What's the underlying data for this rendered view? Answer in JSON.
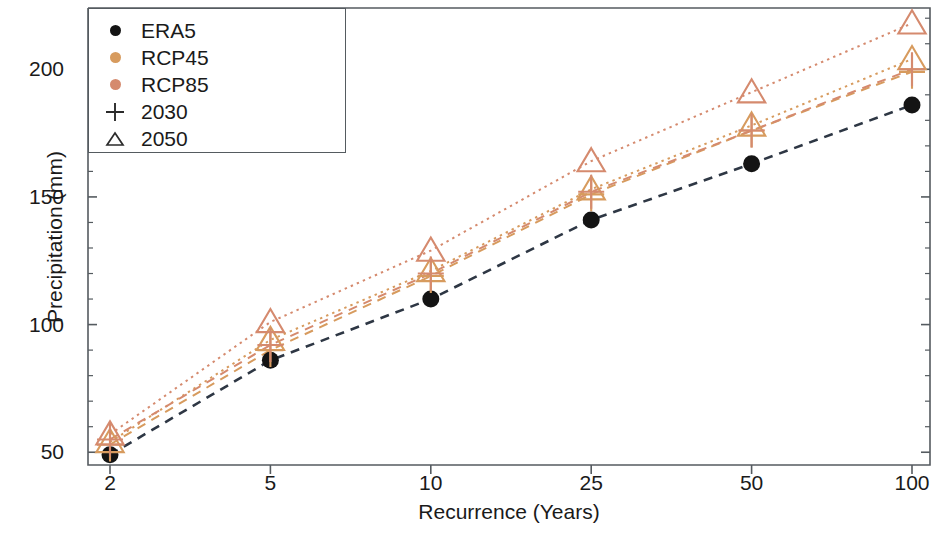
{
  "chart_data": {
    "type": "scatter",
    "title": "",
    "xlabel": "Recurrence (Years)",
    "ylabel": "Precipitation (mm)",
    "categories": [
      "2",
      "5",
      "10",
      "25",
      "50",
      "100"
    ],
    "x_tick_labels": [
      "2",
      "5",
      "10",
      "25",
      "50",
      "100"
    ],
    "y_tick_labels": [
      "50",
      "100",
      "150",
      "200"
    ],
    "y_ticks": [
      50,
      100,
      150,
      200
    ],
    "ylim": [
      45,
      224
    ],
    "grid": false,
    "legend_position": "upper-left",
    "series": [
      {
        "name": "ERA5",
        "dataset": "ERA5",
        "period": "",
        "marker": "circle",
        "color": "#141414",
        "line_style": "dashed",
        "values": [
          49,
          86,
          110,
          141,
          163,
          186
        ]
      },
      {
        "name": "RCP45 2030",
        "dataset": "RCP45",
        "period": "2030",
        "marker": "plus",
        "color": "#d79b5e",
        "line_style": "dashed",
        "values": [
          53,
          90,
          119,
          151,
          176,
          199
        ]
      },
      {
        "name": "RCP45 2050",
        "dataset": "RCP45",
        "period": "2050",
        "marker": "triangle",
        "color": "#d79b5e",
        "line_style": "dotted",
        "values": [
          54,
          94,
          121,
          153,
          178,
          204
        ]
      },
      {
        "name": "RCP85 2030",
        "dataset": "RCP85",
        "period": "2030",
        "marker": "plus",
        "color": "#d58a6e",
        "line_style": "dashed",
        "values": [
          55,
          92,
          120,
          152,
          176,
          200
        ]
      },
      {
        "name": "RCP85 2050",
        "dataset": "RCP85",
        "period": "2050",
        "marker": "triangle",
        "color": "#d58a6e",
        "line_style": "dotted",
        "values": [
          57,
          101,
          129,
          164,
          191,
          218
        ]
      }
    ],
    "legend_entries": [
      {
        "label": "ERA5",
        "marker": "circle",
        "color": "#141414"
      },
      {
        "label": "RCP45",
        "marker": "circle",
        "color": "#d79b5e"
      },
      {
        "label": "RCP85",
        "marker": "circle",
        "color": "#d58a6e"
      },
      {
        "label": "2030",
        "marker": "plus",
        "color": "#2b2b2b"
      },
      {
        "label": "2050",
        "marker": "triangle",
        "color": "#2b2b2b"
      }
    ],
    "colors": {
      "era5": "#141414",
      "era5_line": "#2e3744",
      "rcp45": "#d79b5e",
      "rcp85": "#d58a6e",
      "axis": "#555b60",
      "text": "#1a1a1a"
    }
  }
}
